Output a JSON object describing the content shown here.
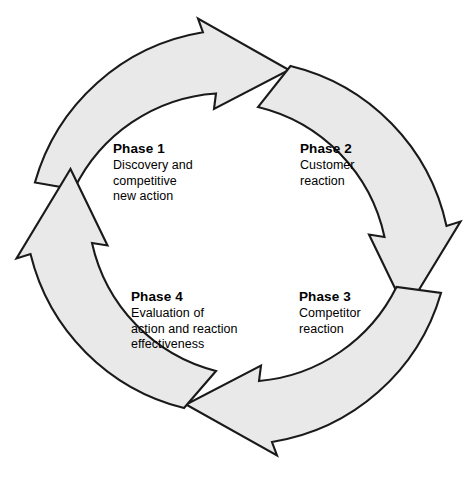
{
  "diagram": {
    "type": "cycle",
    "direction": "clockwise",
    "shape": "ring-of-curved-arrows",
    "colors": {
      "arrow_fill": "#e9e9e9",
      "arrow_stroke": "#1a1a1a",
      "text": "#000000",
      "background": "#ffffff"
    },
    "geometry": {
      "center_x": 238,
      "center_y": 237,
      "outer_radius": 210,
      "inner_radius": 170
    },
    "phases": [
      {
        "id": "phase-1",
        "title": "Phase 1",
        "description": "Discovery and\ncompetitive\nnew action",
        "position": "top-left"
      },
      {
        "id": "phase-2",
        "title": "Phase 2",
        "description": "Customer\nreaction",
        "position": "top-right"
      },
      {
        "id": "phase-3",
        "title": "Phase 3",
        "description": "Competitor\nreaction",
        "position": "bottom-right"
      },
      {
        "id": "phase-4",
        "title": "Phase 4",
        "description": "Evaluation of\naction and reaction\neffectiveness",
        "position": "bottom-left"
      }
    ],
    "arrows": [
      {
        "id": "arrow-top",
        "from": "phase-4-zone",
        "to": "phase-1-zone",
        "points_to": "right"
      },
      {
        "id": "arrow-right",
        "from": "phase-1-zone",
        "to": "phase-2-zone",
        "points_to": "down"
      },
      {
        "id": "arrow-bottom",
        "from": "phase-2-zone",
        "to": "phase-3-zone",
        "points_to": "left"
      },
      {
        "id": "arrow-left",
        "from": "phase-3-zone",
        "to": "phase-4-zone",
        "points_to": "up"
      }
    ]
  }
}
